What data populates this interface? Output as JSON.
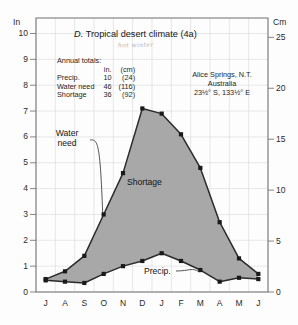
{
  "figure": {
    "title_prefix": "D.",
    "title": "Tropical desert climate (4a)",
    "handwritten_note": "hot winter",
    "left_axis_unit": "In",
    "right_axis_unit": "Cm"
  },
  "annual_totals": {
    "heading": "Annual totals:",
    "col_headers": [
      "in.",
      "(cm)"
    ],
    "rows": [
      {
        "label": "Precip.",
        "inches": "10",
        "cm": "(24)"
      },
      {
        "label": "Water need",
        "inches": "46",
        "cm": "(116)"
      },
      {
        "label": "Shortage",
        "inches": "36",
        "cm": "(92)"
      }
    ]
  },
  "station": {
    "name": "Alice Springs, N.T.",
    "country": "Australia",
    "coordinates": "23½° S, 133½° E"
  },
  "labels": {
    "water_need": "Water\nneed",
    "water_need_line1": "Water",
    "water_need_line2": "need",
    "shortage": "Shortage",
    "precip": "Precip."
  },
  "colors": {
    "shortage_fill": "#a8a8a8",
    "curve_stroke": "#2b2b2b",
    "marker": "#1a1a1a",
    "grid": "#d8d8d8",
    "frame": "#6e6e6e",
    "background": "#fdfdfd"
  },
  "chart_data": {
    "type": "area",
    "xlabel": "",
    "ylabel": "In",
    "y2label": "Cm",
    "ylim": [
      0,
      10.6
    ],
    "y2lim": [
      0,
      26.9
    ],
    "yticks": [
      0,
      1,
      2,
      3,
      4,
      5,
      6,
      7,
      8,
      9,
      10
    ],
    "ytick_labels": [
      "0",
      "1",
      "2",
      "3",
      "4",
      "5",
      "6",
      "7",
      "8",
      "9",
      "10"
    ],
    "y2ticks": [
      0,
      5,
      10,
      15,
      20,
      25
    ],
    "y2tick_labels": [
      "0",
      "5",
      "10",
      "15",
      "20",
      "25"
    ],
    "grid": true,
    "legend": "annotated-inline",
    "categories": [
      "J",
      "A",
      "S",
      "O",
      "N",
      "D",
      "J",
      "F",
      "M",
      "A",
      "M",
      "J"
    ],
    "month_names": [
      "July",
      "August",
      "September",
      "October",
      "November",
      "December",
      "January",
      "February",
      "March",
      "April",
      "May",
      "June"
    ],
    "series": [
      {
        "name": "Water need",
        "units": "inches",
        "values": [
          0.5,
          0.8,
          1.4,
          3.0,
          4.6,
          7.1,
          6.9,
          6.1,
          4.8,
          2.7,
          1.3,
          0.7
        ]
      },
      {
        "name": "Precip.",
        "units": "inches",
        "values": [
          0.45,
          0.4,
          0.35,
          0.7,
          1.0,
          1.2,
          1.5,
          1.2,
          0.85,
          0.4,
          0.55,
          0.5
        ]
      }
    ],
    "shaded_region": {
      "name": "Shortage",
      "between": [
        "Water need",
        "Precip."
      ],
      "annual_total_inches": 36,
      "annual_total_cm": 92
    }
  }
}
